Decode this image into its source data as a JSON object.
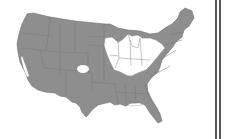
{
  "map": {
    "type": "choropleth",
    "region": "United States (contiguous)",
    "colors": {
      "filled": "#8e8e8e",
      "unfilled": "#ffffff",
      "border": "#6f6f6f",
      "frame": "#555555"
    },
    "unfilled_regions": [
      "Iowa",
      "Illinois",
      "Indiana",
      "Ohio",
      "Kentucky",
      "Lower Michigan",
      "Southern Wisconsin",
      "Northern Missouri",
      "Colorado (spot)",
      "California (central valley sliver)"
    ],
    "filled_regions": "all other states"
  }
}
